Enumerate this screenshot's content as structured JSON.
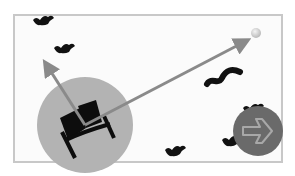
{
  "game": {
    "title": "",
    "colors": {
      "frame_border": "#c8c8c8",
      "background": "#fbfbfb",
      "range_circle": "#b3b3b3",
      "vector_arrow": "#8a8a8a",
      "target_ball": "#d8d8d8",
      "bats": "#111111",
      "next_button": "#6a6a6a"
    },
    "player": {
      "name": "catapult",
      "x": 85,
      "y": 125
    },
    "range_circle": {
      "cx": 85,
      "cy": 125,
      "r": 48
    },
    "aim_arrows": [
      {
        "name": "vertical-vector",
        "from": [
          85,
          125
        ],
        "to": [
          45,
          63
        ]
      },
      {
        "name": "launch-vector",
        "from": [
          85,
          125
        ],
        "to": [
          248,
          40
        ]
      }
    ],
    "target": {
      "x": 256,
      "y": 33
    },
    "bats": [
      {
        "x": 42,
        "y": 20,
        "shape": "bat"
      },
      {
        "x": 63,
        "y": 48,
        "shape": "bat"
      },
      {
        "x": 222,
        "y": 75,
        "shape": "worm"
      },
      {
        "x": 175,
        "y": 152,
        "shape": "bat"
      },
      {
        "x": 232,
        "y": 140,
        "shape": "bat"
      },
      {
        "x": 253,
        "y": 108,
        "shape": "bat"
      }
    ],
    "next_button": {
      "label": "→"
    }
  }
}
